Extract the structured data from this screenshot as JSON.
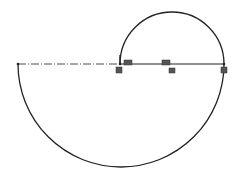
{
  "diagram": {
    "type": "cad-sketch",
    "colors": {
      "stroke": "#222222",
      "constraint_fill": "#555555",
      "background": "#ffffff"
    },
    "entities": {
      "centerline": {
        "x1": 18,
        "y1": 64,
        "x2": 120,
        "y2": 64,
        "style": "dash-dot"
      },
      "baseline": {
        "x1": 120,
        "y1": 64,
        "x2": 224,
        "y2": 64
      },
      "small_arc": {
        "cx": 172,
        "cy": 64,
        "r": 52,
        "from": [
          120,
          64
        ],
        "to": [
          224,
          64
        ],
        "side": "top"
      },
      "large_arc": {
        "cx": 121,
        "cy": 64,
        "r": 103,
        "from": [
          18,
          64
        ],
        "to": [
          224,
          64
        ],
        "side": "bottom"
      }
    },
    "points": [
      {
        "name": "left-endpoint",
        "x": 18,
        "y": 64
      },
      {
        "name": "inner-endpoint",
        "x": 120,
        "y": 64
      },
      {
        "name": "right-endpoint",
        "x": 224,
        "y": 64
      }
    ],
    "constraint_glyphs": [
      {
        "name": "coincident-glyph-inner",
        "x": 116,
        "y": 67,
        "w": 6,
        "h": 6
      },
      {
        "name": "horizontal-glyph-inner",
        "x": 124,
        "y": 60,
        "w": 8,
        "h": 5
      },
      {
        "name": "horizontal-glyph-mid",
        "x": 162,
        "y": 60,
        "w": 8,
        "h": 5
      },
      {
        "name": "equal-glyph-mid",
        "x": 169,
        "y": 68,
        "w": 6,
        "h": 5
      },
      {
        "name": "coincident-glyph-right",
        "x": 221,
        "y": 67,
        "w": 6,
        "h": 6
      }
    ]
  }
}
